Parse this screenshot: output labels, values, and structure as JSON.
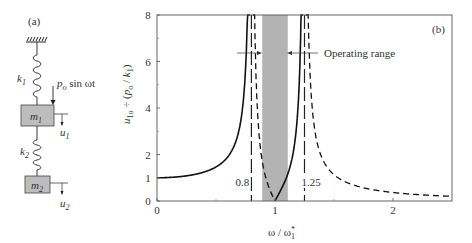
{
  "panel_a": {
    "label": "(a)",
    "k1": "k",
    "k1_sub": "1",
    "k2": "k",
    "k2_sub": "2",
    "m1": "m",
    "m1_sub": "1",
    "m2": "m",
    "m2_sub": "2",
    "force": "p",
    "force_sub": "o",
    "force_rest": " sin ωt",
    "u1": "u",
    "u1_sub": "1",
    "u2": "u",
    "u2_sub": "2",
    "mass_fill": "#bdbdbd"
  },
  "chart_data": {
    "type": "line",
    "panel_label": "(b)",
    "title": "",
    "xlabel": "ω / ω₁*",
    "ylabel": "u₁ₒ ÷ (pₒ / k₁)",
    "xlim": [
      0,
      2.5
    ],
    "ylim": [
      0,
      8
    ],
    "xticks": [
      0,
      1,
      2
    ],
    "xtick_labels": [
      "0",
      "1",
      "2"
    ],
    "yticks": [
      0,
      1,
      2,
      4,
      6,
      8
    ],
    "ytick_labels": [
      "0",
      "1",
      "2",
      "4",
      "6",
      "8"
    ],
    "grid": false,
    "asymptotes": [
      {
        "x": 0.8,
        "label": "0.8",
        "style": "long-dash"
      },
      {
        "x": 1.25,
        "label": "1.25",
        "style": "long-dash"
      }
    ],
    "shaded_region": {
      "x0": 0.9,
      "x1": 1.1,
      "color": "#b3b3b3",
      "label": "Operating range"
    },
    "series": [
      {
        "name": "in-phase (solid)",
        "style": "solid",
        "x": [
          0,
          0.2,
          0.4,
          0.5,
          0.6,
          0.7,
          0.75,
          0.78,
          0.79,
          1.0,
          1.05,
          1.1,
          1.15,
          1.2,
          1.22,
          1.235
        ],
        "y": [
          1.0,
          1.04,
          1.2,
          1.37,
          1.72,
          2.6,
          3.9,
          6.0,
          8.0,
          0.0,
          0.45,
          1.1,
          2.1,
          4.5,
          6.6,
          8.0
        ]
      },
      {
        "name": "out-of-phase (dashed)",
        "style": "short-dash",
        "x": [
          0.81,
          0.83,
          0.86,
          0.9,
          0.95,
          1.0,
          1.27,
          1.3,
          1.4,
          1.5,
          1.7,
          2.0,
          2.3,
          2.5
        ],
        "y": [
          8.0,
          5.5,
          3.2,
          1.8,
          0.8,
          0.0,
          8.0,
          5.0,
          2.6,
          1.7,
          1.0,
          0.62,
          0.47,
          0.4
        ]
      }
    ]
  }
}
